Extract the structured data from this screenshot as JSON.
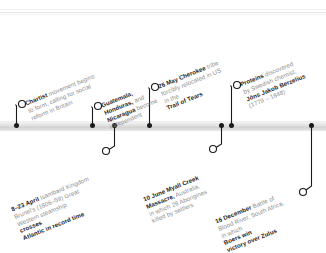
{
  "document": {
    "type": "historical-timeline",
    "year_context": "1838",
    "orientation": "horizontal",
    "axis_color": "#d2d2d2",
    "marker_color": "#1a1a1a",
    "body_text_color": "#8e8e8e",
    "highlight_text_color": "#1d1d1d"
  },
  "timeline": {
    "above_entries": [
      {
        "id": "chartist",
        "lines": [
          {
            "bold": "Chartist",
            "text": " movement begins"
          },
          {
            "bold": "",
            "text": "to form, calling for social"
          },
          {
            "bold": "",
            "text": "reform in Britain"
          }
        ]
      },
      {
        "id": "central-america",
        "lines": [
          {
            "bold": "Guatemala,",
            "text": ""
          },
          {
            "bold": "Honduras,",
            "text": " and"
          },
          {
            "bold": "Nicaragua",
            "text": " become"
          },
          {
            "bold": "",
            "text": "independent"
          }
        ]
      },
      {
        "id": "cherokee",
        "lines": [
          {
            "bold": "26 May Cherokee",
            "text": " tribe"
          },
          {
            "bold": "",
            "text": "forcibly relocated in US"
          },
          {
            "bold": "",
            "text": "in the "
          },
          {
            "bold": "Trail of Tears",
            "text": ""
          }
        ]
      },
      {
        "id": "proteins",
        "lines": [
          {
            "bold": "Proteins",
            "text": " discovered"
          },
          {
            "bold": "",
            "text": "by Swedish chemist,"
          },
          {
            "bold": "Jöns Jakob Berzelius",
            "text": ""
          },
          {
            "bold": "",
            "text": "(1779 – 1848)"
          }
        ]
      }
    ],
    "below_entries": [
      {
        "id": "great-western",
        "lines": [
          {
            "bold": "8–23 April",
            "text": " Isambard Kingdom"
          },
          {
            "bold": "",
            "text": "Brunel's (1806–59) Great"
          },
          {
            "bold": "",
            "text": "Western steamship "
          },
          {
            "bold": "crosses",
            "text": ""
          },
          {
            "bold": "Atlantic in record time",
            "text": ""
          }
        ]
      },
      {
        "id": "myall-creek",
        "lines": [
          {
            "bold": "10 June Myall Creek",
            "text": ""
          },
          {
            "bold": "Massacre,",
            "text": " Australia,"
          },
          {
            "bold": "",
            "text": "in which 28 Aborigines"
          },
          {
            "bold": "",
            "text": "killed by settlers"
          }
        ]
      },
      {
        "id": "blood-river",
        "lines": [
          {
            "bold": "16 December",
            "text": " Battle of"
          },
          {
            "bold": "",
            "text": "Blood River, South Africa,"
          },
          {
            "bold": "",
            "text": "in which "
          },
          {
            "bold": "Boers win",
            "text": ""
          },
          {
            "bold": "victory over Zulus",
            "text": ""
          }
        ]
      }
    ]
  }
}
